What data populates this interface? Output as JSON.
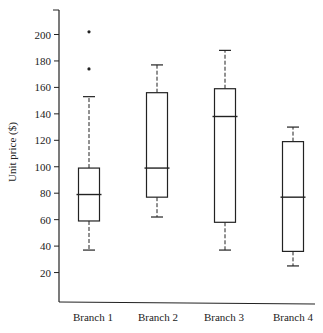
{
  "chart_data": {
    "type": "box",
    "title": "",
    "xlabel": "",
    "ylabel": "Unit price ($)",
    "ylim": [
      0,
      215
    ],
    "yticks": [
      20,
      40,
      60,
      80,
      100,
      120,
      140,
      160,
      180,
      200
    ],
    "grid": false,
    "legend": null,
    "categories": [
      "Branch 1",
      "Branch 2",
      "Branch 3",
      "Branch 4"
    ],
    "series": [
      {
        "name": "Branch 1",
        "whisker_low": 37,
        "q1": 59,
        "median": 79,
        "q3": 99,
        "whisker_high": 153,
        "outliers": [
          174,
          202
        ]
      },
      {
        "name": "Branch 2",
        "whisker_low": 62,
        "q1": 77,
        "median": 99,
        "q3": 156,
        "whisker_high": 177,
        "outliers": []
      },
      {
        "name": "Branch 3",
        "whisker_low": 37,
        "q1": 58,
        "median": 138,
        "q3": 159,
        "whisker_high": 188,
        "outliers": []
      },
      {
        "name": "Branch 4",
        "whisker_low": 25,
        "q1": 36,
        "median": 77,
        "q3": 119,
        "whisker_high": 130,
        "outliers": []
      }
    ],
    "colors": {
      "line": "#222222",
      "background": "#ffffff"
    }
  }
}
